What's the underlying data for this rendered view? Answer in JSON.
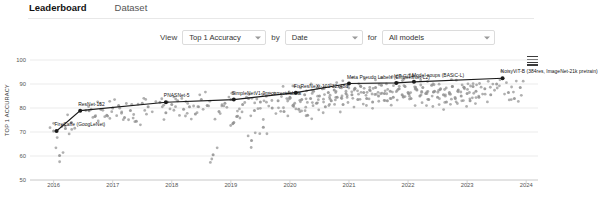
{
  "tabs": [
    {
      "label": "Leaderboard",
      "active": true
    },
    {
      "label": "Dataset",
      "active": false
    }
  ],
  "controls": {
    "view_word": "View",
    "by_word": "by",
    "for_word": "for",
    "metric": {
      "value": "Top 1 Accuracy",
      "options": [
        "Top 1 Accuracy"
      ]
    },
    "axis": {
      "value": "Date",
      "options": [
        "Date"
      ]
    },
    "filter": {
      "value": "All models",
      "options": [
        "All models"
      ]
    }
  },
  "menu_icon": "hamburger-menu-icon",
  "colors": {
    "frontier_line": "#1a1a1a",
    "scatter_point": "#8e8e8e",
    "grid": "#e6e6e6",
    "tab_active": "#111111"
  },
  "chart_data": {
    "type": "scatter",
    "title": "",
    "xlabel": "",
    "ylabel": "TOP 1 ACCURACY",
    "xlim": [
      2015.6,
      2024.2
    ],
    "ylim": [
      50,
      100
    ],
    "xticks": [
      "2016",
      "2017",
      "2018",
      "2019",
      "2020",
      "2021",
      "2022",
      "2023",
      "2024"
    ],
    "yticks": [
      "50",
      "60",
      "70",
      "80",
      "90",
      "100"
    ],
    "grid": true,
    "legend": "none",
    "series": [
      {
        "name": "State-of-the-art frontier",
        "type": "line",
        "points": [
          {
            "x": 2016.05,
            "y": 70.4,
            "label": "FireCaffe (GoogLeNet)"
          },
          {
            "x": 2016.45,
            "y": 78.9,
            "label": "ResNet-152"
          },
          {
            "x": 2017.9,
            "y": 82.4,
            "label": "PNASNet-5"
          },
          {
            "x": 2019.05,
            "y": 83.5,
            "label": "SimpleNetV1-9m-correct-labels"
          },
          {
            "x": 2020.1,
            "y": 86.4,
            "label": "FixResNeXt-101 32x48d"
          },
          {
            "x": 2021.0,
            "y": 90.2,
            "label": "Meta Pseudo Labels (EfficientNet-L2)"
          },
          {
            "x": 2021.8,
            "y": 90.45,
            "label": "ViT-G/14"
          },
          {
            "x": 2022.1,
            "y": 90.9,
            "label": "Model soups (BASiC-L)"
          },
          {
            "x": 2023.6,
            "y": 92.4,
            "label": "NoisyViT-B (384res, ImageNet-21k pretrain)"
          }
        ]
      },
      {
        "name": "All models",
        "type": "scatter",
        "note": "gray cloud of individual model results, densest between 2020 and 2023 in the 78-90 range",
        "x": [
          2016.0,
          2016.1,
          2016.2,
          2016.3,
          2016.6,
          2016.7,
          2016.8,
          2016.9,
          2017.0,
          2017.1,
          2017.2,
          2017.3,
          2017.4,
          2017.5,
          2017.6,
          2017.8,
          2017.9,
          2018.0,
          2018.1,
          2018.2,
          2018.3,
          2018.4,
          2018.5,
          2018.6,
          2018.7,
          2018.8,
          2018.9,
          2019.0,
          2019.05,
          2019.1,
          2019.2,
          2019.3,
          2019.35,
          2019.4,
          2019.5,
          2019.55,
          2019.6,
          2019.7,
          2019.8,
          2019.9,
          2019.95,
          2020.0,
          2020.05,
          2020.1,
          2020.15,
          2020.2,
          2020.25,
          2020.3,
          2020.35,
          2020.4,
          2020.45,
          2020.5,
          2020.55,
          2020.6,
          2020.65,
          2020.7,
          2020.75,
          2020.8,
          2020.85,
          2020.9,
          2020.95,
          2021.0,
          2021.05,
          2021.1,
          2021.15,
          2021.2,
          2021.25,
          2021.3,
          2021.35,
          2021.4,
          2021.45,
          2021.5,
          2021.55,
          2021.6,
          2021.65,
          2021.7,
          2021.75,
          2021.8,
          2021.85,
          2021.9,
          2021.95,
          2022.0,
          2022.05,
          2022.1,
          2022.15,
          2022.2,
          2022.25,
          2022.3,
          2022.35,
          2022.4,
          2022.45,
          2022.5,
          2022.55,
          2022.6,
          2022.65,
          2022.7,
          2022.75,
          2022.8,
          2022.85,
          2022.9,
          2022.95,
          2023.0,
          2023.05,
          2023.1,
          2023.15,
          2023.2,
          2023.3,
          2023.4,
          2023.5,
          2023.6,
          2023.7,
          2023.8,
          2023.9
        ],
        "y": [
          70.4,
          60.2,
          71.5,
          74.0,
          78.9,
          76.5,
          79.5,
          77.0,
          80.0,
          81.0,
          76.0,
          79.0,
          74.5,
          82.0,
          80.5,
          82.4,
          78.0,
          81.5,
          83.0,
          79.5,
          80.5,
          77.5,
          83.5,
          81.0,
          60.5,
          78.5,
          82.0,
          83.5,
          74.0,
          76.5,
          81.5,
          84.0,
          66.5,
          79.0,
          82.5,
          72.0,
          85.0,
          80.0,
          83.0,
          78.5,
          86.0,
          84.5,
          81.0,
          86.4,
          79.5,
          83.5,
          85.5,
          77.0,
          84.0,
          87.0,
          82.0,
          85.0,
          88.0,
          80.5,
          86.5,
          83.0,
          87.5,
          84.5,
          88.5,
          81.5,
          86.0,
          90.2,
          85.5,
          88.0,
          83.5,
          89.0,
          86.5,
          84.0,
          87.5,
          82.5,
          88.5,
          85.0,
          89.5,
          86.0,
          83.0,
          87.0,
          84.5,
          90.45,
          88.0,
          85.5,
          89.0,
          86.5,
          84.0,
          90.9,
          87.5,
          85.0,
          88.5,
          86.0,
          83.5,
          89.5,
          87.0,
          84.5,
          88.0,
          85.5,
          82.5,
          86.5,
          89.0,
          84.0,
          87.5,
          85.0,
          88.5,
          86.0,
          83.0,
          89.0,
          87.0,
          84.5,
          88.0,
          85.5,
          90.0,
          92.4,
          86.5,
          84.0,
          88.5
        ]
      }
    ]
  }
}
